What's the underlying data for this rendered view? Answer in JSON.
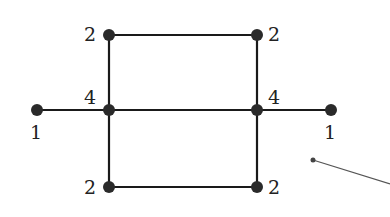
{
  "diagram": {
    "type": "graph",
    "nodes": [
      {
        "id": "top-left",
        "x": 109,
        "y": 35,
        "label": "2",
        "label_pos": "left"
      },
      {
        "id": "top-right",
        "x": 257,
        "y": 35,
        "label": "2",
        "label_pos": "right"
      },
      {
        "id": "mid-left",
        "x": 109,
        "y": 110,
        "label": "4",
        "label_pos": "top-left"
      },
      {
        "id": "mid-right",
        "x": 257,
        "y": 110,
        "label": "4",
        "label_pos": "top-right"
      },
      {
        "id": "far-left",
        "x": 37,
        "y": 110,
        "label": "1",
        "label_pos": "below"
      },
      {
        "id": "far-right",
        "x": 331,
        "y": 110,
        "label": "1",
        "label_pos": "below"
      },
      {
        "id": "bottom-left",
        "x": 109,
        "y": 187,
        "label": "2",
        "label_pos": "left"
      },
      {
        "id": "bottom-right",
        "x": 257,
        "y": 187,
        "label": "2",
        "label_pos": "right"
      }
    ],
    "edges": [
      [
        "top-left",
        "top-right"
      ],
      [
        "top-left",
        "mid-left"
      ],
      [
        "top-right",
        "mid-right"
      ],
      [
        "far-left",
        "mid-left"
      ],
      [
        "mid-left",
        "mid-right"
      ],
      [
        "mid-right",
        "far-right"
      ],
      [
        "mid-left",
        "bottom-left"
      ],
      [
        "mid-right",
        "bottom-right"
      ],
      [
        "bottom-left",
        "bottom-right"
      ]
    ],
    "pointer": {
      "x1": 313,
      "y1": 160,
      "x2": 390,
      "y2": 184
    }
  },
  "labels": {
    "top_left": "2",
    "top_right": "2",
    "mid_left": "4",
    "mid_right": "4",
    "far_left": "1",
    "far_right": "1",
    "bottom_left": "2",
    "bottom_right": "2"
  }
}
